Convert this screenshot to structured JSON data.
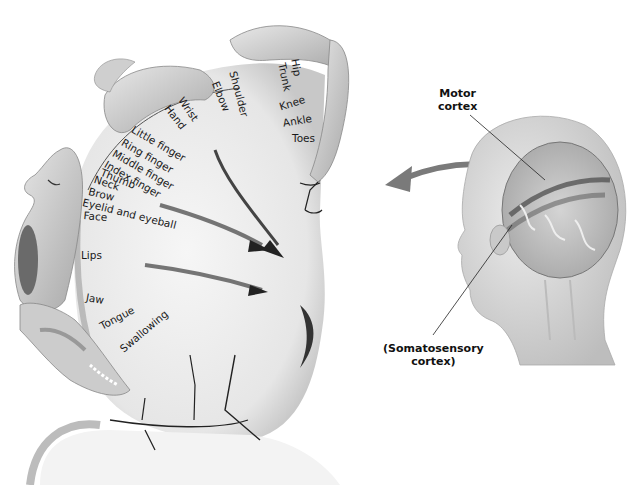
{
  "figure": {
    "callouts": {
      "motor_cortex": "Motor\ncortex",
      "motor_cortex_line1": "Motor",
      "motor_cortex_line2": "cortex",
      "somatosensory_line1": "(Somatosensory",
      "somatosensory_line2": "cortex)"
    },
    "body_part_labels": [
      {
        "id": "hip",
        "text": "Hip"
      },
      {
        "id": "trunk",
        "text": "Trunk"
      },
      {
        "id": "shoulder",
        "text": "Shoulder"
      },
      {
        "id": "elbow",
        "text": "Elbow"
      },
      {
        "id": "wrist",
        "text": "Wrist"
      },
      {
        "id": "hand",
        "text": "Hand"
      },
      {
        "id": "knee",
        "text": "Knee"
      },
      {
        "id": "ankle",
        "text": "Ankle"
      },
      {
        "id": "toes",
        "text": "Toes"
      },
      {
        "id": "little_finger",
        "text": "Little finger"
      },
      {
        "id": "ring_finger",
        "text": "Ring finger"
      },
      {
        "id": "middle_finger",
        "text": "Middle finger"
      },
      {
        "id": "index_finger",
        "text": "Index finger"
      },
      {
        "id": "thumb",
        "text": "Thumb"
      },
      {
        "id": "neck",
        "text": "Neck"
      },
      {
        "id": "brow",
        "text": "Brow"
      },
      {
        "id": "eyelid",
        "text": "Eyelid and eyeball"
      },
      {
        "id": "face",
        "text": "Face"
      },
      {
        "id": "lips",
        "text": "Lips"
      },
      {
        "id": "jaw",
        "text": "Jaw"
      },
      {
        "id": "tongue",
        "text": "Tongue"
      },
      {
        "id": "swallowing",
        "text": "Swallowing"
      }
    ],
    "colors": {
      "ink": "#1a1a1a",
      "skin": "#d6d6d6",
      "cortex": "#eeeeee",
      "shadow": "#9a9a9a"
    }
  }
}
